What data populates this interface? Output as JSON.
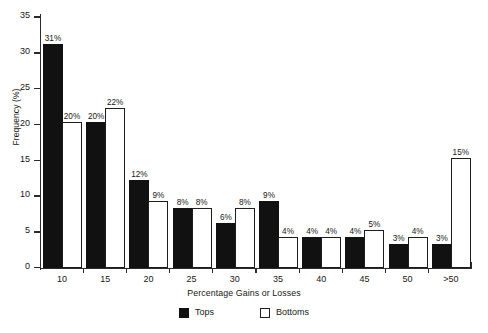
{
  "chart_data": {
    "type": "bar",
    "title": "",
    "xlabel": "Percentage Gains or Losses",
    "ylabel": "Frequency (%)",
    "categories": [
      "10",
      "15",
      "20",
      "25",
      "30",
      "35",
      "40",
      "45",
      "50",
      ">50"
    ],
    "series": [
      {
        "name": "Tops",
        "color": "#111111",
        "fill": "solid",
        "values": [
          31,
          20,
          12,
          8,
          6,
          9,
          4,
          4,
          3,
          3
        ],
        "labels": [
          "31%",
          "20%",
          "12%",
          "8%",
          "6%",
          "9%",
          "4%",
          "4%",
          "3%",
          "3%"
        ]
      },
      {
        "name": "Bottoms",
        "color": "#ffffff",
        "fill": "hollow",
        "values": [
          20,
          22,
          9,
          8,
          8,
          4,
          4,
          5,
          4,
          15
        ],
        "labels": [
          "20%",
          "22%",
          "9%",
          "8%",
          "8%",
          "4%",
          "4%",
          "5%",
          "4%",
          "15%"
        ]
      }
    ],
    "ylim": [
      0,
      35
    ],
    "yticks": [
      0,
      5,
      10,
      15,
      20,
      25,
      30,
      35
    ],
    "ytick_labels": [
      "0",
      "5",
      "10",
      "15",
      "20",
      "25",
      "30",
      "35"
    ],
    "grid": false,
    "legend_position": "bottom"
  },
  "legend": {
    "items": [
      {
        "label": "Tops",
        "swatch": "filled"
      },
      {
        "label": "Bottoms",
        "swatch": "hollow"
      }
    ]
  }
}
